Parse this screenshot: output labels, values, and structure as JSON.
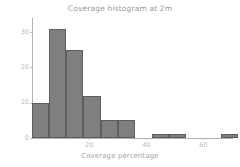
{
  "chart_data": {
    "type": "bar",
    "title": "Coverage histogram at 2m",
    "xlabel": "Coverage percentage",
    "ylabel": "",
    "xlim": [
      0,
      70
    ],
    "ylim": [
      0,
      34
    ],
    "grid": false,
    "legend": null,
    "bin_width": 6,
    "categories": [
      "0",
      "6",
      "12",
      "18",
      "24",
      "30",
      "36",
      "42",
      "48",
      "54",
      "60",
      "66"
    ],
    "x": [
      0,
      6,
      12,
      18,
      24,
      30,
      36,
      42,
      48,
      54,
      60,
      66
    ],
    "values": [
      10,
      31,
      25,
      12,
      5,
      5,
      0,
      1,
      1,
      0,
      0,
      1
    ],
    "bars": [
      {
        "x_left": 0,
        "x_right": 6,
        "value": 10
      },
      {
        "x_left": 6,
        "x_right": 12,
        "value": 31
      },
      {
        "x_left": 12,
        "x_right": 18,
        "value": 25
      },
      {
        "x_left": 18,
        "x_right": 24,
        "value": 12
      },
      {
        "x_left": 24,
        "x_right": 30,
        "value": 5
      },
      {
        "x_left": 30,
        "x_right": 36,
        "value": 5
      },
      {
        "x_left": 36,
        "x_right": 42,
        "value": 0
      },
      {
        "x_left": 42,
        "x_right": 48,
        "value": 1
      },
      {
        "x_left": 48,
        "x_right": 54,
        "value": 1
      },
      {
        "x_left": 54,
        "x_right": 60,
        "value": 0
      },
      {
        "x_left": 60,
        "x_right": 66,
        "value": 0
      },
      {
        "x_left": 66,
        "x_right": 72,
        "value": 1
      }
    ],
    "yticks": [
      0,
      10,
      20,
      30
    ],
    "ytick_labels": [
      "0",
      "10",
      "20",
      "30"
    ],
    "xticks": [
      20,
      40,
      60
    ],
    "xtick_labels": [
      "20",
      "40",
      "60"
    ],
    "colors": {
      "bar_fill": "#7f7f7f",
      "bar_edge": "#5e5e5e",
      "title_text": "#9a9a9a",
      "tick_text": "#bdbdbd",
      "axis_line": "#b0b0b0",
      "background": "#ffffff"
    }
  }
}
